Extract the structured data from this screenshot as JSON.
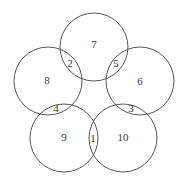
{
  "diagram": {
    "type": "five-circle-ring",
    "stroke_color": "#555555",
    "circles": [
      {
        "id": "top",
        "cx": 94,
        "cy": 47,
        "r": 34,
        "label": "7",
        "lx": 94,
        "ly": 45
      },
      {
        "id": "left",
        "cx": 48,
        "cy": 81,
        "r": 34,
        "label": "8",
        "lx": 47,
        "ly": 81
      },
      {
        "id": "right",
        "cx": 140,
        "cy": 81,
        "r": 34,
        "label": "6",
        "lx": 140,
        "ly": 82
      },
      {
        "id": "bottom-left",
        "cx": 64,
        "cy": 138,
        "r": 34,
        "label": "9",
        "lx": 64,
        "ly": 138
      },
      {
        "id": "bottom-right",
        "cx": 123,
        "cy": 138,
        "r": 34,
        "label": "10",
        "lx": 123,
        "ly": 138
      }
    ],
    "intersections": [
      {
        "label": "2",
        "x": 70,
        "y": 64
      },
      {
        "label": "5",
        "x": 116,
        "y": 64
      },
      {
        "label": "4",
        "x": 56,
        "y": 109
      },
      {
        "label": "3",
        "x": 131,
        "y": 109
      },
      {
        "label": "1",
        "x": 93,
        "y": 139
      }
    ]
  }
}
